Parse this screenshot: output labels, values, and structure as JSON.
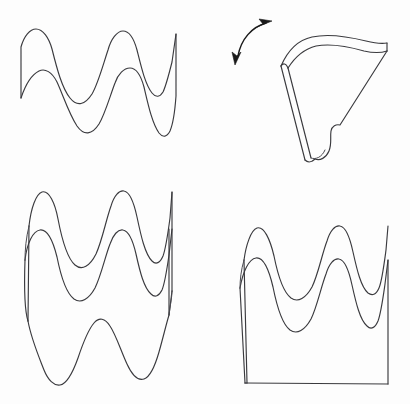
{
  "figure": {
    "background_color": "#fdfdfd",
    "line_color": "#3a3a3e",
    "arrow_color": "#1a1a1a",
    "line_width": 1.15,
    "width": 410,
    "height": 404,
    "panel_count": 4
  },
  "panels": [
    {
      "id": "top-left",
      "name": "edge-on-wave-view",
      "label": "Edge-on view of double wavy edge",
      "bounds": {
        "x": 10,
        "y": 20,
        "width": 175,
        "height": 130
      },
      "elements": [
        "upper-wave-curve",
        "lower-wave-curve",
        "left-end-segment",
        "right-end-segment"
      ],
      "wave": {
        "crest_count": 3,
        "trough_count": 3,
        "description": "two parallel sinuous curves joined at left and right by short straight end edges"
      }
    },
    {
      "id": "top-right",
      "name": "perspective-folded-view",
      "label": "Perspective view of folded sheet with rotation arrow",
      "bounds": {
        "x": 228,
        "y": 14,
        "width": 170,
        "height": 155
      },
      "elements": [
        "rotation-arrow",
        "front-face-outline",
        "top-ridge-edge",
        "left-thickness-band",
        "bottom-wavy-notch"
      ],
      "arrow": {
        "type": "double-headed-curved-arrow",
        "direction": "rotation",
        "head_count": 2
      }
    },
    {
      "id": "bottom-left",
      "name": "open-cylinder-wave-view",
      "label": "Open corrugated band seen from the side",
      "bounds": {
        "x": 18,
        "y": 185,
        "width": 170,
        "height": 205
      },
      "elements": [
        "top-outer-wave",
        "top-inner-wave",
        "bottom-wave",
        "left-side-edge",
        "left-thickness-sliver",
        "right-side-edge"
      ],
      "wave": {
        "crest_count": 3,
        "trough_count": 3
      }
    },
    {
      "id": "bottom-right",
      "name": "solid-block-wave-view",
      "label": "Corrugated top surface on a rectangular block",
      "bounds": {
        "x": 232,
        "y": 218,
        "width": 168,
        "height": 170
      },
      "elements": [
        "outer-wave-top-edge",
        "inner-wave-edge",
        "left-vertical-edge",
        "left-thickness-sliver",
        "right-vertical-edge",
        "bottom-base-edge"
      ],
      "wave": {
        "crest_count": 3,
        "trough_count": 3
      }
    }
  ]
}
